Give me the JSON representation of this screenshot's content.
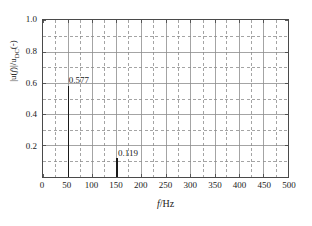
{
  "chart_data": {
    "type": "bar",
    "title": "",
    "subtitle": "",
    "xlabel_text": "f",
    "xlabel_unit": "/Hz",
    "ylabel_prefix": "|u(",
    "ylabel_var": "f",
    "ylabel_mid": ")|/u",
    "ylabel_sub": "DC",
    "ylabel_suffix": "(-)",
    "xlim": [
      0,
      500
    ],
    "ylim": [
      0,
      1.0
    ],
    "x": [
      50,
      150
    ],
    "values": [
      0.577,
      0.119
    ],
    "xticks": [
      0,
      50,
      100,
      150,
      200,
      250,
      300,
      350,
      400,
      450,
      500
    ],
    "xticklabels": [
      "0",
      "50",
      "100",
      "150",
      "200",
      "250",
      "300",
      "350",
      "400",
      "450",
      "500"
    ],
    "yticks": [
      0.2,
      0.4,
      0.6,
      0.8,
      1.0
    ],
    "yticklabels": [
      "0.2",
      "0.4",
      "0.6",
      "0.8",
      "1.0"
    ],
    "x_minor_step": 25,
    "y_minor_step": 0.1,
    "grid": true,
    "grid_major_style": "solid",
    "grid_minor_style": "dashed",
    "grid_color": "#8c8c8c",
    "legend": null,
    "annotations": [
      {
        "text": "0.577",
        "x": 50,
        "y": 0.577
      },
      {
        "text": "0.119",
        "x": 150,
        "y": 0.119
      }
    ],
    "series_color": "#1a1a1a",
    "axis_color": "#4a4a4a",
    "background": "#ffffff"
  }
}
